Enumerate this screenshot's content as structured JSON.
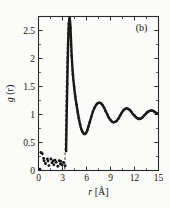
{
  "figure": {
    "panel_label": "(b)",
    "background_color": "#fbfbfa",
    "line_color": "#1a1a1a"
  },
  "chart_data": {
    "type": "scatter",
    "title": "",
    "subtitle": "",
    "panel": "(b)",
    "xlabel": "r [Å]",
    "ylabel": "g (r)",
    "ylabel_parts": {
      "symbol": "g",
      "arg": "(r)"
    },
    "xlim": [
      0,
      15
    ],
    "ylim": [
      0,
      2.75
    ],
    "xticks": [
      0,
      3,
      6,
      9,
      12,
      15
    ],
    "xtick_labels": [
      "0",
      "3",
      "6",
      "9",
      "12",
      "15"
    ],
    "yticks": [
      0,
      0.5,
      1,
      1.5,
      2,
      2.5
    ],
    "ytick_labels": [
      "0",
      "0.5",
      "1",
      "1.5",
      "2",
      "2.5"
    ],
    "x_minor_tick_step": 1.5,
    "y_minor_tick_step": 0.25,
    "grid": false,
    "legend": null,
    "legend_position": "none",
    "annotations": [
      {
        "text": "(b)",
        "x": 13.6,
        "y": 2.5
      }
    ],
    "series": [
      {
        "name": "g(r)",
        "style": "scatter-dense",
        "marker": "filled-circle",
        "color": "#151515",
        "x": [
          0.15,
          0.3,
          0.45,
          0.6,
          0.75,
          0.9,
          1.05,
          1.2,
          1.35,
          1.5,
          1.65,
          1.8,
          1.95,
          2.1,
          2.25,
          2.4,
          2.55,
          2.7,
          2.85,
          3.0,
          3.15,
          3.3,
          3.45,
          3.6,
          3.7,
          3.8,
          3.9,
          4.0,
          4.15,
          4.3,
          4.45,
          4.6,
          4.75,
          4.9,
          5.05,
          5.2,
          5.35,
          5.5,
          5.65,
          5.8,
          5.95,
          6.1,
          6.25,
          6.4,
          6.6,
          6.8,
          7.0,
          7.2,
          7.4,
          7.6,
          7.8,
          8.0,
          8.2,
          8.4,
          8.6,
          8.8,
          9.0,
          9.2,
          9.4,
          9.6,
          9.8,
          10.0,
          10.2,
          10.4,
          10.6,
          10.8,
          11.0,
          11.2,
          11.4,
          11.6,
          11.8,
          12.0,
          12.2,
          12.4,
          12.6,
          12.8,
          13.0,
          13.2,
          13.4,
          13.6,
          13.8,
          14.0,
          14.2,
          14.4,
          14.6,
          14.8,
          15.0
        ],
        "y": [
          0.02,
          0.33,
          0.3,
          0.22,
          0.18,
          0.12,
          0.2,
          0.16,
          0.09,
          0.21,
          0.13,
          0.17,
          0.11,
          0.19,
          0.14,
          0.08,
          0.18,
          0.12,
          0.16,
          0.1,
          0.14,
          0.08,
          0.35,
          1.55,
          2.25,
          2.62,
          2.72,
          2.55,
          2.05,
          1.72,
          1.5,
          1.32,
          1.18,
          1.05,
          0.93,
          0.82,
          0.74,
          0.69,
          0.66,
          0.65,
          0.67,
          0.72,
          0.79,
          0.86,
          0.96,
          1.05,
          1.12,
          1.17,
          1.2,
          1.21,
          1.2,
          1.17,
          1.12,
          1.06,
          1.0,
          0.94,
          0.9,
          0.87,
          0.86,
          0.87,
          0.89,
          0.93,
          0.98,
          1.03,
          1.07,
          1.1,
          1.11,
          1.1,
          1.08,
          1.05,
          1.01,
          0.98,
          0.95,
          0.93,
          0.92,
          0.93,
          0.95,
          0.98,
          1.01,
          1.04,
          1.06,
          1.07,
          1.07,
          1.06,
          1.04,
          1.02,
          1.01
        ]
      }
    ],
    "guide_line": {
      "style": "dashed",
      "description": "dashed guide through the leading edge of the first coordination peak",
      "x": [
        3.28,
        3.33,
        3.4,
        3.52,
        3.68,
        3.8,
        3.88,
        3.96,
        4.05,
        4.2,
        4.45,
        4.8,
        5.2,
        5.6,
        5.9
      ],
      "y": [
        0.02,
        0.3,
        0.9,
        1.8,
        2.5,
        2.74,
        2.7,
        2.45,
        2.15,
        1.8,
        1.42,
        1.05,
        0.8,
        0.68,
        0.66
      ]
    },
    "features": {
      "first_peak_position": 3.8,
      "first_peak_height": 2.74,
      "first_minimum_position": 5.8,
      "first_minimum_value": 0.65,
      "second_peak_position": 7.6,
      "second_peak_height": 1.21,
      "asymptote": 1.0
    }
  }
}
